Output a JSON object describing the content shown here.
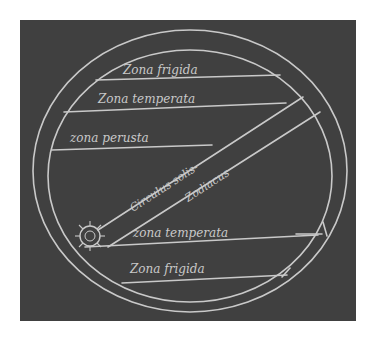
{
  "diagram": {
    "type": "climate-zones-map",
    "zones": [
      {
        "id": "zone-frigida-north",
        "label": "Zona frigida"
      },
      {
        "id": "zone-temperata-north",
        "label": "Zona temperata"
      },
      {
        "id": "zone-perusta",
        "label": "zona perusta"
      },
      {
        "id": "zone-temperata-south",
        "label": "zona temperata"
      },
      {
        "id": "zone-frigida-south",
        "label": "Zona frigida"
      }
    ],
    "band": {
      "label_line1": "Circulus solis-",
      "label_line2": "Zodiacus"
    },
    "sun": {
      "label": "sun"
    },
    "colors": {
      "background": "#404040",
      "lines": "#c9c9c9",
      "page": "#ffffff"
    }
  }
}
